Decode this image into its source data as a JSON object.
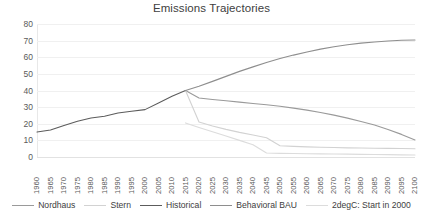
{
  "chart_data": {
    "type": "line",
    "title": "Emissions Trajectories",
    "xlabel": "",
    "ylabel": "",
    "ylim": [
      0,
      80
    ],
    "ytick_step": 10,
    "yticks": [
      "0",
      "10",
      "20",
      "30",
      "40",
      "50",
      "60",
      "70",
      "80"
    ],
    "grid": true,
    "legend_position": "bottom",
    "x": [
      1960,
      1965,
      1970,
      1975,
      1980,
      1985,
      1990,
      1995,
      2000,
      2005,
      2010,
      2015,
      2020,
      2025,
      2030,
      2035,
      2040,
      2045,
      2050,
      2055,
      2060,
      2065,
      2070,
      2075,
      2080,
      2085,
      2090,
      2095,
      2100
    ],
    "xticks": [
      "1960",
      "1965",
      "1970",
      "1975",
      "1980",
      "1985",
      "1990",
      "1995",
      "2000",
      "2005",
      "2010",
      "2015",
      "2020",
      "2025",
      "2030",
      "2035",
      "2040",
      "2045",
      "2050",
      "2055",
      "2060",
      "2065",
      "2070",
      "2075",
      "2080",
      "2085",
      "2090",
      "2095",
      "2100"
    ],
    "series": [
      {
        "name": "Nordhaus",
        "color": "#9a9a9a",
        "x": [
          2015,
          2020,
          2025,
          2030,
          2035,
          2040,
          2045,
          2050,
          2055,
          2060,
          2065,
          2070,
          2075,
          2080,
          2085,
          2090,
          2095,
          2100
        ],
        "values": [
          40.0,
          35.5,
          34.6,
          33.8,
          33.0,
          32.2,
          31.4,
          30.5,
          29.4,
          28.2,
          26.8,
          25.2,
          23.4,
          21.4,
          19.2,
          16.6,
          13.6,
          10.2
        ]
      },
      {
        "name": "Stern",
        "color": "#d2d2d2",
        "x": [
          2015,
          2020,
          2025,
          2030,
          2035,
          2040,
          2045,
          2050,
          2055,
          2060,
          2065,
          2070,
          2075,
          2080,
          2085,
          2090,
          2095,
          2100
        ],
        "values": [
          40.0,
          21.0,
          18.6,
          16.6,
          14.8,
          13.2,
          11.6,
          6.8,
          6.4,
          6.1,
          5.9,
          5.7,
          5.5,
          5.4,
          5.3,
          5.2,
          5.1,
          5.0
        ]
      },
      {
        "name": "Historical",
        "color": "#5c5c5c",
        "x": [
          1960,
          1965,
          1970,
          1975,
          1980,
          1985,
          1990,
          1995,
          2000,
          2005,
          2010,
          2015
        ],
        "values": [
          15.0,
          16.2,
          19.0,
          21.5,
          23.5,
          24.5,
          26.5,
          27.5,
          28.5,
          32.5,
          36.5,
          40.0
        ]
      },
      {
        "name": "Behavioral BAU",
        "color": "#8e8e8e",
        "x": [
          2015,
          2020,
          2025,
          2030,
          2035,
          2040,
          2045,
          2050,
          2055,
          2060,
          2065,
          2070,
          2075,
          2080,
          2085,
          2090,
          2095,
          2100
        ],
        "values": [
          40.0,
          42.5,
          45.5,
          48.5,
          51.5,
          54.2,
          56.8,
          59.2,
          61.3,
          63.2,
          64.9,
          66.3,
          67.5,
          68.5,
          69.2,
          69.8,
          70.2,
          70.4
        ]
      },
      {
        "name": "2degC: Start in 2000",
        "color": "#dcdcdc",
        "x": [
          2015,
          2020,
          2025,
          2030,
          2035,
          2040,
          2045,
          2050,
          2055,
          2060,
          2065,
          2070,
          2075,
          2080,
          2085,
          2090,
          2095,
          2100
        ],
        "values": [
          20.5,
          17.8,
          15.2,
          12.6,
          10.0,
          7.4,
          2.4,
          2.2,
          2.1,
          2.0,
          1.9,
          1.8,
          1.7,
          1.6,
          1.5,
          1.4,
          1.3,
          1.2
        ]
      }
    ]
  }
}
